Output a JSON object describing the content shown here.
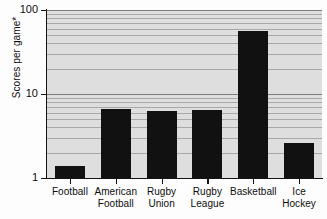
{
  "chart_data": {
    "type": "bar",
    "title": "",
    "xlabel": "",
    "ylabel": "Scores per game*",
    "yscale": "log",
    "ylim": [
      1,
      100
    ],
    "ytick_labels": [
      "100",
      "10",
      "1"
    ],
    "ytick_values": [
      100,
      10,
      1
    ],
    "grid": true,
    "grid_orientation": "horizontal",
    "legend": "none",
    "bar_color": "#111111",
    "plot_background": "#dedede",
    "categories": [
      "Football",
      "American\nFootball",
      "Rugby\nUnion",
      "Rugby\nLeague",
      "Basketball",
      "Ice\nHockey"
    ],
    "values": [
      1.4,
      6.7,
      6.2,
      6.4,
      56,
      2.6
    ],
    "series": [
      {
        "name": "Scores per game*",
        "values": [
          1.4,
          6.7,
          6.2,
          6.4,
          56,
          2.6
        ]
      }
    ]
  },
  "axis": {
    "y_title": "Scores per game*",
    "ticks": [
      {
        "label": "100",
        "value": 100
      },
      {
        "label": "10",
        "value": 10
      },
      {
        "label": "1",
        "value": 1
      }
    ]
  },
  "bars": [
    {
      "label": "Football",
      "label_display": "Football",
      "value": 1.4
    },
    {
      "label": "American Football",
      "label_display": "American\nFootball",
      "value": 6.7
    },
    {
      "label": "Rugby Union",
      "label_display": "Rugby\nUnion",
      "value": 6.2
    },
    {
      "label": "Rugby League",
      "label_display": "Rugby\nLeague",
      "value": 6.4
    },
    {
      "label": "Basketball",
      "label_display": "Basketball",
      "value": 56
    },
    {
      "label": "Ice Hockey",
      "label_display": "Ice\nHockey",
      "value": 2.6
    }
  ]
}
